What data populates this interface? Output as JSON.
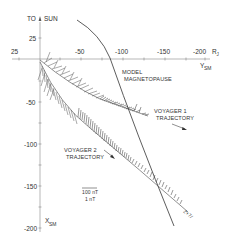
{
  "figure": {
    "axes": {
      "x_axis_label": "Y",
      "x_axis_subscript": "SM",
      "y_axis_label": "X",
      "y_axis_subscript": "SM",
      "sun_direction_label": "TO",
      "sun_label": "SUN",
      "unit_label": "R",
      "unit_subscript": "J",
      "x_ticks": [
        "25",
        "-50",
        "-100",
        "-150",
        "-200"
      ],
      "y_ticks": [
        "25",
        "-50",
        "-100",
        "-150",
        "-200"
      ]
    },
    "annotations": {
      "magnetopause_line1": "MODEL",
      "magnetopause_line2": "MAGNETOPAUSE",
      "voyager1_line1": "VOYAGER  1",
      "voyager1_line2": "TRAJECTORY",
      "voyager2_line1": "VOYAGER  2",
      "voyager2_line2": "TRAJECTORY",
      "scale_numerator": "100 nT",
      "scale_denominator": "1 nT",
      "end_marker": "2+7/"
    },
    "colors": {
      "ink": "#333333",
      "axis": "#888888",
      "background": "#ffffff"
    }
  }
}
